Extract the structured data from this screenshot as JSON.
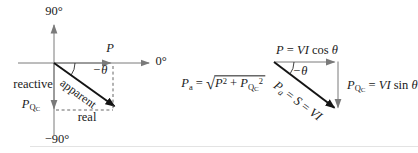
{
  "colors": {
    "background": "#ffffff",
    "axis": "#7a7a7a",
    "vector": "#141414",
    "dash": "#555555",
    "text": "#1a1a1a",
    "bottom_rule": "#e3e3e3"
  },
  "left_diagram": {
    "deg90": "90°",
    "deg0": "0°",
    "degNeg90": "−90°",
    "P": "P",
    "negTheta": "−θ",
    "apparent": "apparent",
    "reactive": "reactive",
    "real": "real",
    "PQC": {
      "base": "P",
      "sub": "Q",
      "subsub": "C"
    }
  },
  "right_diagram": {
    "negTheta": "−θ",
    "topFormula": {
      "P": "P",
      "eq": " = ",
      "VI": "VI",
      "cos": " cos ",
      "theta": "θ"
    },
    "hypFormula": {
      "P": "P",
      "sub": "a",
      "eq1": " = ",
      "S": "S",
      "eq2": " = ",
      "VI": "VI"
    },
    "sqrtFormula": {
      "P": "P",
      "sub": "a",
      "eq": " = ",
      "radical": "√",
      "t1base": "P",
      "t1sup": "2",
      "plus": " + ",
      "t2base": "P",
      "t2sub": "Q",
      "t2subsub": "C",
      "t2sup": "2"
    },
    "rightFormula": {
      "P": "P",
      "sub": "Q",
      "subsub": "C",
      "eq": " = ",
      "VI": "VI",
      "sin": " sin ",
      "theta": "θ"
    }
  }
}
